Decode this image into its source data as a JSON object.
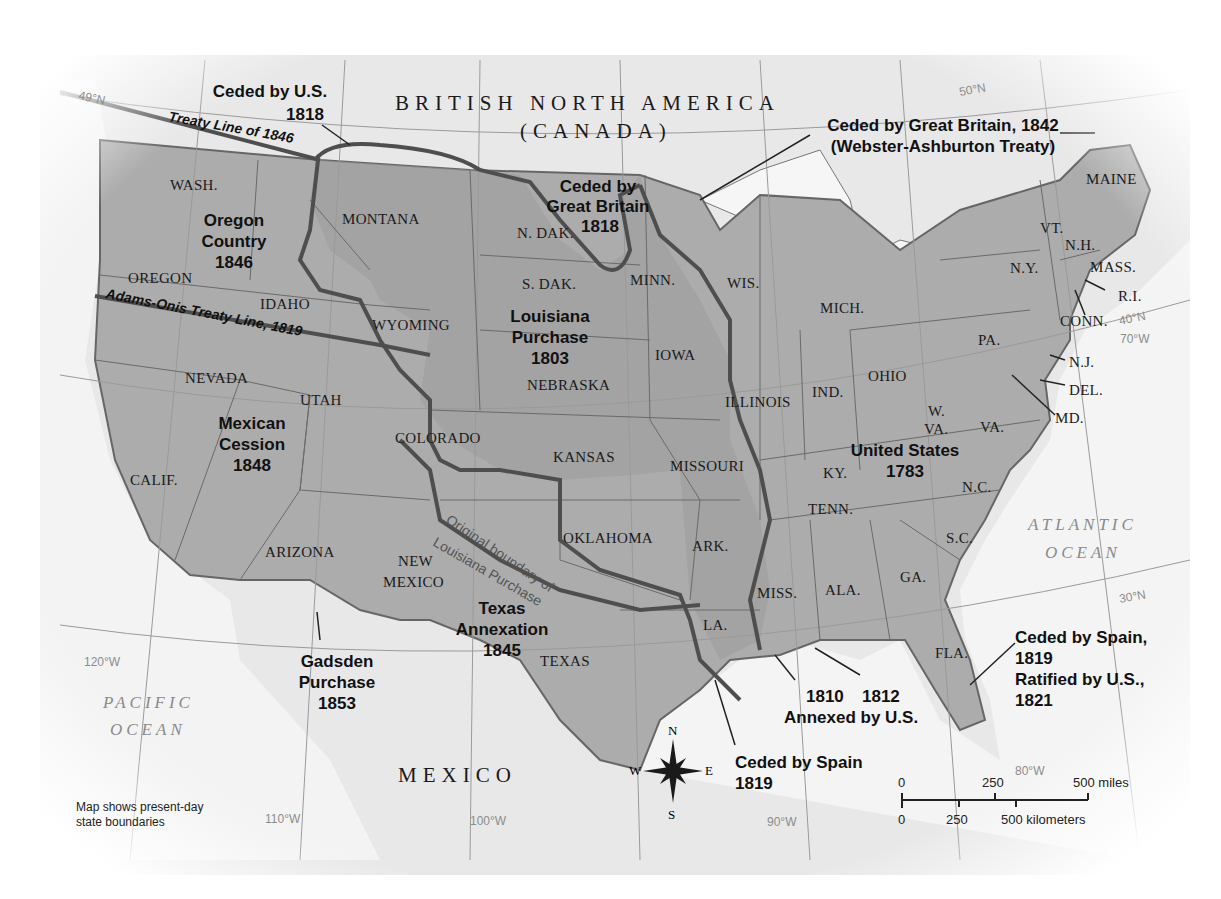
{
  "map": {
    "title": "Territorial Growth of the United States",
    "colors": {
      "background": "#ffffff",
      "foreign_land": "#e6e6e6",
      "us_land": "#a9a9a9",
      "water": "#f2f2f2",
      "boundary_line": "#555555",
      "text": "#111111",
      "grid": "#9a9a9a"
    },
    "countries": {
      "british": "BRITISH NORTH AMERICA",
      "canada": "(CANADA)",
      "mexico": "MEXICO"
    },
    "oceans": {
      "pacific_1": "PACIFIC",
      "pacific_2": "OCEAN",
      "atlantic_1": "ATLANTIC",
      "atlantic_2": "OCEAN"
    },
    "coordinates": {
      "lat49": "49°N",
      "lat50": "50°N",
      "lat40": "40°N",
      "lat30": "30°N",
      "lon120": "120°W",
      "lon110": "110°W",
      "lon100": "100°W",
      "lon90": "90°W",
      "lon80": "80°W",
      "lon70": "70°W"
    },
    "treaty_lines": {
      "treaty_1846": "Treaty Line of 1846",
      "adams_onis": "Adams-Onis Treaty Line, 1819",
      "original_boundary_1": "Original boundary of",
      "original_boundary_2": "Louisiana Purchase"
    },
    "regions": {
      "ceded_us_1818": [
        "Ceded by U.S.",
        "1818"
      ],
      "ceded_gb_1842": [
        "Ceded by Great Britain, 1842",
        "(Webster-Ashburton Treaty)"
      ],
      "ceded_gb_1818": [
        "Ceded by",
        "Great Britain",
        "1818"
      ],
      "oregon_country": [
        "Oregon",
        "Country",
        "1846"
      ],
      "louisiana_purchase": [
        "Louisiana",
        "Purchase",
        "1803"
      ],
      "mexican_cession": [
        "Mexican",
        "Cession",
        "1848"
      ],
      "united_states": [
        "United States",
        "1783"
      ],
      "texas_annexation": [
        "Texas",
        "Annexation",
        "1845"
      ],
      "gadsden_purchase": [
        "Gadsden",
        "Purchase",
        "1853"
      ],
      "ceded_spain_1819": [
        "Ceded by Spain",
        "1819"
      ],
      "annexed": [
        "1810",
        "1812",
        "Annexed by U.S."
      ],
      "ceded_spain_florida": [
        "Ceded by Spain,",
        "1819",
        "Ratified by U.S.,",
        "1821"
      ]
    },
    "states": {
      "wash": "WASH.",
      "oregon": "OREGON",
      "idaho": "IDAHO",
      "montana": "MONTANA",
      "wyoming": "WYOMING",
      "nevada": "NEVADA",
      "utah": "UTAH",
      "calif": "CALIF.",
      "colorado": "COLORADO",
      "arizona": "ARIZONA",
      "new_mexico_1": "NEW",
      "new_mexico_2": "MEXICO",
      "ndak": "N. DAK.",
      "sdak": "S. DAK.",
      "nebraska": "NEBRASKA",
      "kansas": "KANSAS",
      "oklahoma": "OKLAHOMA",
      "texas": "TEXAS",
      "minn": "MINN.",
      "iowa": "IOWA",
      "missouri": "MISSOURI",
      "ark": "ARK.",
      "la": "LA.",
      "wis": "WIS.",
      "illinois": "ILLINOIS",
      "mich": "MICH.",
      "ind": "IND.",
      "ohio": "OHIO",
      "ky": "KY.",
      "tenn": "TENN.",
      "miss": "MISS.",
      "ala": "ALA.",
      "ga": "GA.",
      "fla": "FLA.",
      "sc": "S.C.",
      "nc": "N.C.",
      "va": "VA.",
      "wva_1": "W.",
      "wva_2": "VA.",
      "pa": "PA.",
      "ny": "N.Y.",
      "vt": "VT.",
      "nh": "N.H.",
      "maine": "MAINE",
      "mass": "MASS.",
      "ri": "R.I.",
      "conn": "CONN.",
      "nj": "N.J.",
      "del": "DEL.",
      "md": "MD."
    },
    "compass": {
      "n": "N",
      "s": "S",
      "e": "E",
      "w": "W"
    },
    "scale_bar": {
      "miles": [
        "0",
        "250",
        "500 miles"
      ],
      "km": [
        "0",
        "250",
        "500 kilometers"
      ]
    },
    "note": [
      "Map shows present-day",
      "state boundaries"
    ]
  }
}
